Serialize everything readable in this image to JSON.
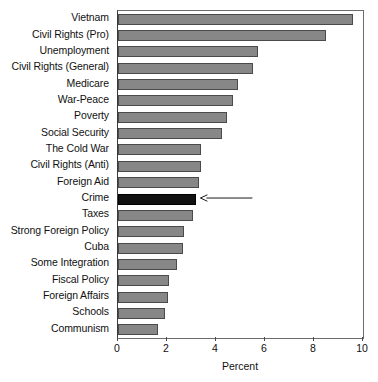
{
  "chart_data": {
    "type": "bar",
    "orientation": "horizontal",
    "title": "",
    "xlabel": "Percent",
    "ylabel": "",
    "xlim": [
      0,
      10
    ],
    "xticks": [
      0,
      2,
      4,
      6,
      8,
      10
    ],
    "xtick_labels": [
      "0",
      "2",
      "4",
      "6",
      "8",
      "10"
    ],
    "grid": false,
    "legend": null,
    "categories": [
      "Vietnam",
      "Civil Rights (Pro)",
      "Unemployment",
      "Civil Rights (General)",
      "Medicare",
      "War-Peace",
      "Poverty",
      "Social Security",
      "The Cold War",
      "Civil Rights (Anti)",
      "Foreign Aid",
      "Crime",
      "Taxes",
      "Strong Foreign Policy",
      "Cuba",
      "Some Integration",
      "Fiscal Policy",
      "Foreign Affairs",
      "Schools",
      "Communism"
    ],
    "values": [
      9.6,
      8.5,
      5.7,
      5.5,
      4.9,
      4.7,
      4.45,
      4.25,
      3.4,
      3.4,
      3.3,
      3.2,
      3.05,
      2.7,
      2.65,
      2.4,
      2.1,
      2.05,
      1.9,
      1.65
    ],
    "highlighted_category": "Crime",
    "bar_color": "#878787",
    "highlight_color": "#111111",
    "bar_edge_color": "#4a4a4a"
  },
  "annotation": {
    "target_category": "Crime",
    "arrow_direction": "left",
    "label": ""
  }
}
